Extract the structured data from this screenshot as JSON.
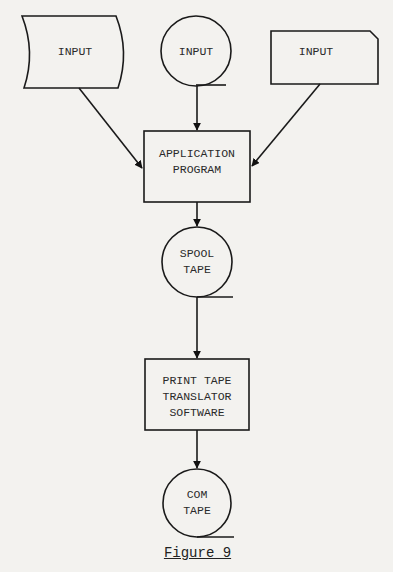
{
  "diagram": {
    "type": "flowchart",
    "nodes": [
      {
        "id": "input_punched_tape",
        "shape": "punched-tape",
        "label": "INPUT"
      },
      {
        "id": "input_magnetic_tape",
        "shape": "magnetic-tape",
        "label": "INPUT"
      },
      {
        "id": "input_card",
        "shape": "punched-card",
        "label": "INPUT"
      },
      {
        "id": "application_program",
        "shape": "process",
        "label": "APPLICATION\nPROGRAM"
      },
      {
        "id": "spool_tape",
        "shape": "magnetic-tape",
        "label": "SPOOL\nTAPE"
      },
      {
        "id": "print_tape_translator",
        "shape": "process",
        "label": "PRINT TAPE\nTRANSLATOR\nSOFTWARE"
      },
      {
        "id": "com_tape",
        "shape": "magnetic-tape",
        "label": "COM\nTAPE"
      }
    ],
    "edges": [
      {
        "from": "input_punched_tape",
        "to": "application_program"
      },
      {
        "from": "input_magnetic_tape",
        "to": "application_program"
      },
      {
        "from": "input_card",
        "to": "application_program"
      },
      {
        "from": "application_program",
        "to": "spool_tape"
      },
      {
        "from": "spool_tape",
        "to": "print_tape_translator"
      },
      {
        "from": "print_tape_translator",
        "to": "com_tape"
      }
    ],
    "caption": "Figure 9"
  }
}
